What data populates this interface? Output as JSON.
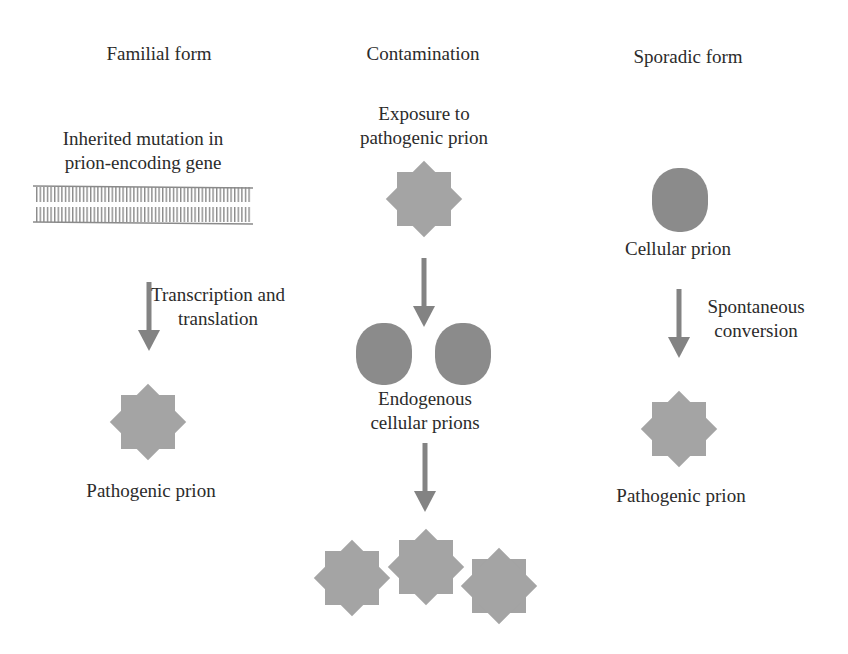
{
  "columns": {
    "familial": {
      "title": "Familial form",
      "gene_label_line1": "Inherited mutation in",
      "gene_label_line2": "prion-encoding gene",
      "step_label_line1": "Transcription and",
      "step_label_line2": "translation",
      "result_label": "Pathogenic prion"
    },
    "contamination": {
      "title": "Contamination",
      "exposure_line1": "Exposure to",
      "exposure_line2": "pathogenic prion",
      "endogenous_line1": "Endogenous",
      "endogenous_line2": "cellular prions"
    },
    "sporadic": {
      "title": "Sporadic form",
      "cellular_label": "Cellular prion",
      "step_label_line1": "Spontaneous",
      "step_label_line2": "conversion",
      "result_label": "Pathogenic prion"
    }
  },
  "colors": {
    "pathogenic_prion": "#a4a4a4",
    "cellular_prion": "#8b8b8b",
    "arrow": "#838383",
    "gene": "#8a8a8a",
    "text": "#2b2b2b"
  },
  "legend_icons": {
    "pathogenic_prion": "eight-point-star",
    "cellular_prion": "rounded-blob",
    "gene": "double-strand-dna"
  }
}
